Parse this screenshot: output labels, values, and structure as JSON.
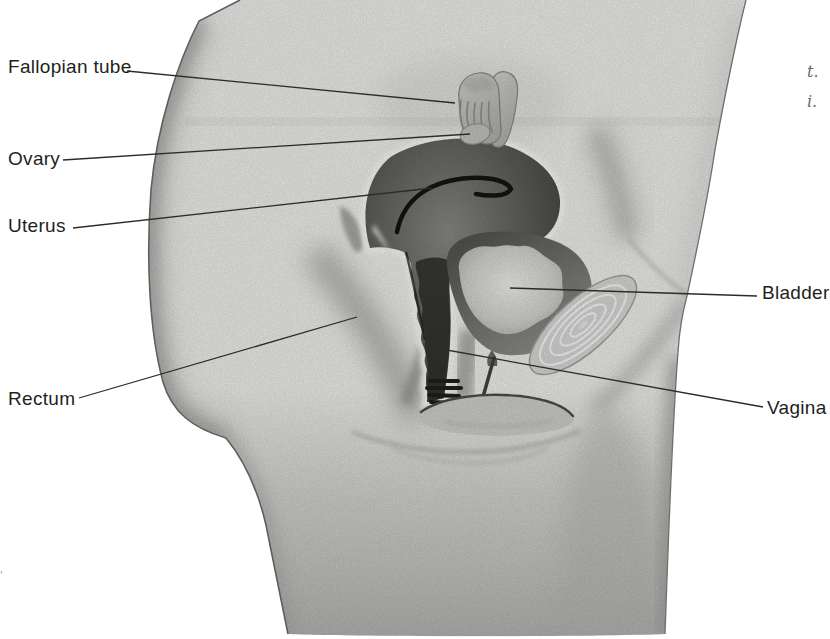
{
  "figure": {
    "type": "anatomical diagram",
    "depicts": "female pelvis, side (sagittal) cross-section illustration",
    "labels": [
      {
        "id": "fallopian-tube",
        "text": "Fallopian tube"
      },
      {
        "id": "ovary",
        "text": "Ovary"
      },
      {
        "id": "uterus",
        "text": "Uterus"
      },
      {
        "id": "rectum",
        "text": "Rectum"
      },
      {
        "id": "bladder",
        "text": "Bladder"
      },
      {
        "id": "vagina",
        "text": "Vagina"
      }
    ],
    "margin_text": {
      "line1": "t.",
      "line2": "i."
    },
    "edge_artifact": "'"
  },
  "colors": {
    "background": "#ffffff",
    "body_fill": "#f0f0ee",
    "organ_dark": "#3a3a38",
    "bladder_interior": "#e9e9e7",
    "leader_line": "#2b2b29",
    "label_text": "#1f1f1d"
  }
}
